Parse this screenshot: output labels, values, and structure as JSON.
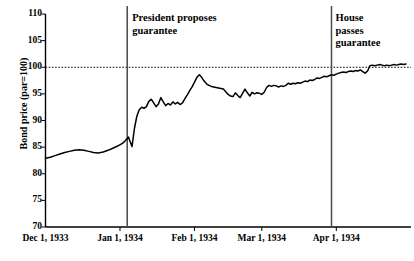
{
  "chart_data": {
    "type": "line",
    "title": "",
    "subtitle": "",
    "xlabel": "",
    "ylabel": "Bond price (par=100)",
    "ylim": [
      70,
      110
    ],
    "yticks": [
      70,
      75,
      80,
      85,
      90,
      95,
      100,
      105,
      110
    ],
    "xticks": [
      "Dec 1, 1933",
      "Jan 1, 1934",
      "Feb 1, 1934",
      "Mar 1, 1934",
      "Apr 1, 1934"
    ],
    "xlim": [
      "Dec 1, 1933",
      "Apr 30, 1934"
    ],
    "grid": false,
    "legend": "none",
    "reference_lines": [
      {
        "name": "par-line",
        "orientation": "horizontal",
        "value": 100,
        "style": "dotted"
      },
      {
        "name": "president-proposes-line",
        "orientation": "vertical",
        "value": "Jan 4, 1934",
        "style": "solid",
        "label": "President proposes\nguarantee"
      },
      {
        "name": "house-passes-line",
        "orientation": "vertical",
        "value": "Apr 5, 1934",
        "style": "solid",
        "label": "House\npasses\nguarantee"
      }
    ],
    "series": [
      {
        "name": "Bond price",
        "color": "#000000",
        "x_days": [
          0,
          2,
          4,
          6,
          8,
          10,
          12,
          14,
          16,
          18,
          20,
          22,
          24,
          26,
          28,
          30,
          32,
          33,
          34,
          34.5,
          35,
          36,
          37,
          38,
          39,
          40,
          41,
          42,
          43,
          44,
          45,
          46,
          47,
          48,
          49,
          50,
          51,
          52,
          53,
          54,
          55,
          56,
          57,
          58,
          59,
          60,
          61,
          62,
          63,
          64,
          65,
          66,
          67,
          68,
          69,
          70,
          71,
          72,
          73,
          74,
          75,
          76,
          77,
          78,
          79,
          80,
          81,
          82,
          83,
          84,
          85,
          86,
          87,
          88,
          89,
          90,
          91,
          92,
          93,
          94,
          95,
          96,
          97,
          98,
          99,
          100,
          101,
          102,
          103,
          104,
          105,
          106,
          107,
          108,
          109,
          110,
          111,
          112,
          113,
          114,
          115,
          116,
          117,
          118,
          119,
          120,
          121,
          122,
          123,
          124,
          125,
          126,
          127,
          128,
          129,
          130,
          131,
          132,
          133,
          134,
          135,
          136,
          137,
          138,
          139,
          140,
          141,
          142,
          143,
          144,
          145,
          146,
          147,
          148,
          149,
          150
        ],
        "values": [
          82.9,
          83.1,
          83.4,
          83.7,
          84.0,
          84.2,
          84.4,
          84.5,
          84.4,
          84.2,
          84.0,
          83.9,
          84.1,
          84.4,
          84.8,
          85.2,
          85.7,
          86.1,
          86.6,
          86.9,
          86.3,
          85.1,
          88.5,
          90.8,
          92.0,
          92.5,
          92.3,
          92.6,
          93.6,
          94.0,
          93.3,
          92.6,
          93.1,
          94.3,
          93.5,
          92.8,
          93.2,
          92.9,
          93.5,
          93.1,
          93.4,
          93.0,
          93.3,
          94.1,
          94.8,
          95.6,
          96.3,
          97.2,
          98.1,
          98.6,
          98.1,
          97.4,
          96.9,
          96.6,
          96.4,
          96.3,
          96.2,
          96.1,
          96.0,
          95.9,
          95.4,
          94.9,
          94.6,
          94.5,
          95.2,
          94.7,
          94.3,
          95.1,
          95.9,
          95.2,
          94.6,
          95.3,
          95.0,
          95.2,
          95.1,
          94.9,
          95.3,
          96.2,
          96.6,
          96.4,
          96.6,
          96.5,
          96.3,
          96.5,
          96.4,
          96.6,
          97.0,
          96.8,
          97.0,
          96.9,
          97.1,
          97.0,
          97.2,
          97.4,
          97.3,
          97.6,
          97.5,
          97.7,
          98.0,
          97.9,
          98.1,
          98.3,
          98.2,
          98.4,
          98.6,
          98.5,
          98.7,
          98.9,
          99.0,
          99.1,
          99.0,
          99.2,
          99.3,
          99.2,
          99.4,
          99.3,
          99.5,
          99.2,
          98.9,
          99.3,
          100.3,
          100.4,
          100.3,
          100.4,
          100.5,
          100.4,
          100.3,
          100.4,
          100.3,
          100.4,
          100.5,
          100.4,
          100.5,
          100.6,
          100.5,
          100.6
        ]
      }
    ]
  },
  "annotations": {
    "president": "President proposes\nguarantee",
    "house": "House\npasses\nguarantee"
  }
}
